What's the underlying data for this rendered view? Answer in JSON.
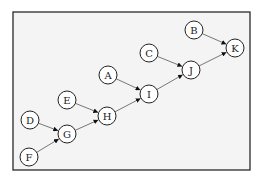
{
  "diagram": {
    "type": "directed-graph",
    "frame": {
      "x": 13,
      "y": 12,
      "width": 237,
      "height": 158
    },
    "node_radius": 9,
    "nodes": [
      {
        "id": "A",
        "label": "A",
        "x": 108,
        "y": 75
      },
      {
        "id": "B",
        "label": "B",
        "x": 194,
        "y": 30
      },
      {
        "id": "C",
        "label": "C",
        "x": 149,
        "y": 53
      },
      {
        "id": "D",
        "label": "D",
        "x": 30,
        "y": 120
      },
      {
        "id": "E",
        "label": "E",
        "x": 67,
        "y": 100
      },
      {
        "id": "F",
        "label": "F",
        "x": 29,
        "y": 157
      },
      {
        "id": "G",
        "label": "G",
        "x": 67,
        "y": 134
      },
      {
        "id": "H",
        "label": "H",
        "x": 107,
        "y": 116
      },
      {
        "id": "I",
        "label": "I",
        "x": 149,
        "y": 94
      },
      {
        "id": "J",
        "label": "J",
        "x": 191,
        "y": 70
      },
      {
        "id": "K",
        "label": "K",
        "x": 235,
        "y": 48
      }
    ],
    "edges": [
      {
        "from": "D",
        "to": "G"
      },
      {
        "from": "F",
        "to": "G"
      },
      {
        "from": "G",
        "to": "H"
      },
      {
        "from": "E",
        "to": "H"
      },
      {
        "from": "H",
        "to": "I"
      },
      {
        "from": "A",
        "to": "I"
      },
      {
        "from": "I",
        "to": "J"
      },
      {
        "from": "C",
        "to": "J"
      },
      {
        "from": "J",
        "to": "K"
      },
      {
        "from": "B",
        "to": "K"
      }
    ],
    "colors": {
      "frame_fill": "#f4f4f4",
      "frame_stroke": "#2a2a2a",
      "node_fill": "#ffffff",
      "node_stroke": "#222222",
      "edge": "#555555"
    }
  }
}
